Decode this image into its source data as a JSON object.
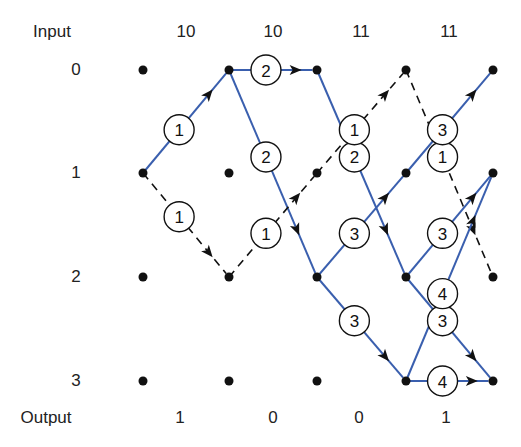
{
  "labels": {
    "input_title": "Input",
    "output_title": "Output"
  },
  "inputs": [
    "10",
    "10",
    "11",
    "11"
  ],
  "outputs": [
    "1",
    "0",
    "0",
    "1"
  ],
  "states": [
    "0",
    "1",
    "2",
    "3"
  ],
  "layout": {
    "columns_x": [
      143,
      229,
      317,
      406,
      493
    ],
    "rows_y": [
      70,
      173,
      277,
      381
    ],
    "input_row_y": 32,
    "output_row_y": 418,
    "state_label_x": 76
  },
  "colors": {
    "solid_edge": "#3a5fae",
    "dashed_edge": "#111111",
    "node": "#111111"
  },
  "edges": [
    {
      "from": [
        0,
        1
      ],
      "to": [
        1,
        0
      ],
      "style": "solid",
      "metric": "1"
    },
    {
      "from": [
        0,
        1
      ],
      "to": [
        1,
        2
      ],
      "style": "dashed",
      "metric": "1"
    },
    {
      "from": [
        1,
        0
      ],
      "to": [
        2,
        0
      ],
      "style": "solid",
      "metric": "2"
    },
    {
      "from": [
        1,
        0
      ],
      "to": [
        2,
        2
      ],
      "style": "solid",
      "metric": "2"
    },
    {
      "from": [
        1,
        2
      ],
      "to": [
        2,
        1
      ],
      "style": "dashed",
      "metric": "1"
    },
    {
      "from": [
        2,
        0
      ],
      "to": [
        3,
        2
      ],
      "style": "solid",
      "metric": "2"
    },
    {
      "from": [
        2,
        1
      ],
      "to": [
        3,
        0
      ],
      "style": "dashed",
      "metric": "1"
    },
    {
      "from": [
        2,
        2
      ],
      "to": [
        3,
        1
      ],
      "style": "solid",
      "metric": "3"
    },
    {
      "from": [
        2,
        2
      ],
      "to": [
        3,
        3
      ],
      "style": "solid",
      "metric": "3"
    },
    {
      "from": [
        3,
        0
      ],
      "to": [
        4,
        2
      ],
      "style": "dashed",
      "metric": "1"
    },
    {
      "from": [
        3,
        1
      ],
      "to": [
        4,
        0
      ],
      "style": "solid",
      "metric": "3"
    },
    {
      "from": [
        3,
        2
      ],
      "to": [
        4,
        1
      ],
      "style": "solid",
      "metric": "3"
    },
    {
      "from": [
        3,
        2
      ],
      "to": [
        4,
        3
      ],
      "style": "solid",
      "metric": "3"
    },
    {
      "from": [
        3,
        3
      ],
      "to": [
        4,
        1
      ],
      "style": "solid",
      "metric": "4"
    },
    {
      "from": [
        3,
        3
      ],
      "to": [
        4,
        3
      ],
      "style": "solid",
      "metric": "4"
    }
  ]
}
